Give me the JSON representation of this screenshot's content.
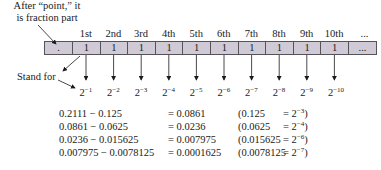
{
  "annotations": {
    "fraction_note_line1": "After “point,” it",
    "fraction_note_line2": "is fraction part",
    "stand_for": "Stand for"
  },
  "positions": {
    "ordinals": [
      "1st",
      "2nd",
      "3rd",
      "4th",
      "5th",
      "6th",
      "7th",
      "8th",
      "9th",
      "10th",
      "..."
    ]
  },
  "register": {
    "point_cell": ".",
    "bits": [
      "1",
      "1",
      "1",
      "1",
      "1",
      "1",
      "1",
      "1",
      "1",
      "1"
    ],
    "ellipsis_cell": "...",
    "cell_color": "#cfcad6",
    "border_color": "#55525a"
  },
  "weights": [
    {
      "base": "2",
      "exp": "−1"
    },
    {
      "base": "2",
      "exp": "−2"
    },
    {
      "base": "2",
      "exp": "−3"
    },
    {
      "base": "2",
      "exp": "−4"
    },
    {
      "base": "2",
      "exp": "−5"
    },
    {
      "base": "2",
      "exp": "−6"
    },
    {
      "base": "2",
      "exp": "−7"
    },
    {
      "base": "2",
      "exp": "−8"
    },
    {
      "base": "2",
      "exp": "−9"
    },
    {
      "base": "2",
      "exp": "−10"
    }
  ],
  "equations": [
    {
      "expr": "0.2111 − 0.125",
      "result": "= 0.0861",
      "paren_value": "(0.125",
      "paren_eq": "= 2",
      "paren_exp": "−3",
      "paren_close": ")"
    },
    {
      "expr": "0.0861 − 0.0625",
      "result": "= 0.0236",
      "paren_value": "(0.0625",
      "paren_eq": "= 2",
      "paren_exp": "−4",
      "paren_close": ")"
    },
    {
      "expr": "0.0236 − 0.015625",
      "result": "= 0.007975",
      "paren_value": "(0.015625",
      "paren_eq": "= 2",
      "paren_exp": "−6",
      "paren_close": ")"
    },
    {
      "expr": "0.007975 − 0.0078125",
      "result": "= 0.0001625",
      "paren_value": "(0.0078125",
      "paren_eq": "= 2",
      "paren_exp": "−7",
      "paren_close": ")"
    }
  ]
}
